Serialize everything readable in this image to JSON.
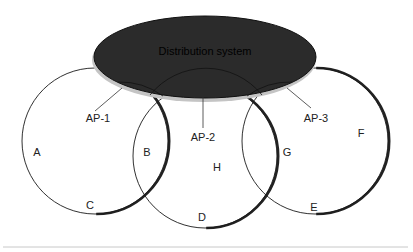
{
  "diagram": {
    "distribution_system": {
      "label": "Distribution system",
      "fill": "#2b2b2b",
      "rim": "#bdbdbd"
    },
    "access_points": [
      {
        "id": "ap1",
        "label": "AP-1"
      },
      {
        "id": "ap2",
        "label": "AP-2"
      },
      {
        "id": "ap3",
        "label": "AP-3"
      }
    ],
    "regions": [
      {
        "id": "A",
        "label": "A"
      },
      {
        "id": "B",
        "label": "B"
      },
      {
        "id": "C",
        "label": "C"
      },
      {
        "id": "D",
        "label": "D"
      },
      {
        "id": "E",
        "label": "E"
      },
      {
        "id": "F",
        "label": "F"
      },
      {
        "id": "G",
        "label": "G"
      },
      {
        "id": "H",
        "label": "H"
      }
    ],
    "colors": {
      "stroke": "#1a1a1a",
      "baseline": "#c8c8c8"
    }
  }
}
